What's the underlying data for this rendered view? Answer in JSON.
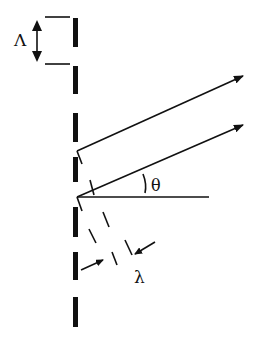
{
  "diagram": {
    "title": "",
    "labels": {
      "grating_period": "Λ",
      "angle": "θ",
      "wavelength": "λ"
    },
    "colors": {
      "ink": "#111111",
      "background": "#ffffff"
    }
  }
}
